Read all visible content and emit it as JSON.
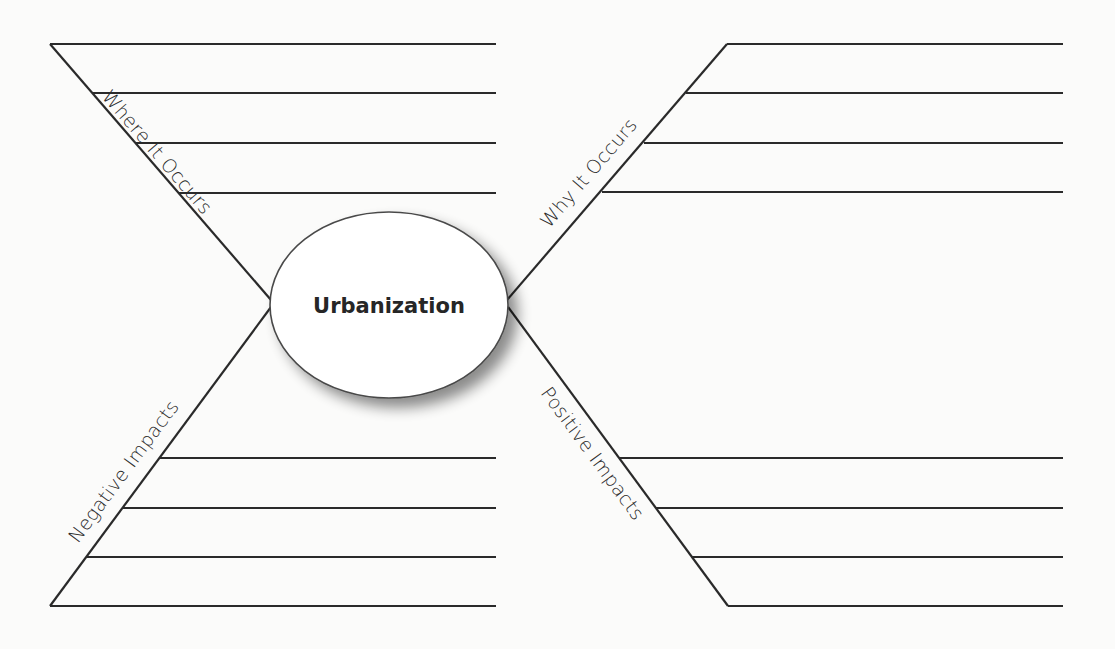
{
  "diagram": {
    "type": "spider-map graphic organizer",
    "center": {
      "label": "Urbanization",
      "cx": 389,
      "cy": 305,
      "rx": 119,
      "ry": 93
    },
    "legs": [
      {
        "id": "top-left",
        "label": "Where It Occurs",
        "diagonal": {
          "x1": 50,
          "y1": 44,
          "x2": 271,
          "y2": 300
        },
        "lines": [
          {
            "x1": 50,
            "y1": 44,
            "x2": 496,
            "y2": 44
          },
          {
            "x1": 93,
            "y1": 93,
            "x2": 496,
            "y2": 93
          },
          {
            "x1": 136,
            "y1": 143,
            "x2": 496,
            "y2": 143
          },
          {
            "x1": 178,
            "y1": 193,
            "x2": 496,
            "y2": 193
          }
        ]
      },
      {
        "id": "top-right",
        "label": "Why It Occurs",
        "diagonal": {
          "x1": 727,
          "y1": 44,
          "x2": 507,
          "y2": 300
        },
        "lines": [
          {
            "x1": 727,
            "y1": 44,
            "x2": 1063,
            "y2": 44
          },
          {
            "x1": 686,
            "y1": 93,
            "x2": 1063,
            "y2": 93
          },
          {
            "x1": 644,
            "y1": 143,
            "x2": 1063,
            "y2": 143
          },
          {
            "x1": 602,
            "y1": 192,
            "x2": 1063,
            "y2": 192
          }
        ]
      },
      {
        "id": "bottom-left",
        "label": "Negative Impacts",
        "diagonal": {
          "x1": 50,
          "y1": 606,
          "x2": 271,
          "y2": 307
        },
        "lines": [
          {
            "x1": 159,
            "y1": 458,
            "x2": 496,
            "y2": 458
          },
          {
            "x1": 122,
            "y1": 508,
            "x2": 496,
            "y2": 508
          },
          {
            "x1": 86,
            "y1": 557,
            "x2": 496,
            "y2": 557
          },
          {
            "x1": 50,
            "y1": 606,
            "x2": 496,
            "y2": 606
          }
        ]
      },
      {
        "id": "bottom-right",
        "label": "Positive Impacts",
        "diagonal": {
          "x1": 508,
          "y1": 307,
          "x2": 728,
          "y2": 606
        },
        "lines": [
          {
            "x1": 619,
            "y1": 458,
            "x2": 1063,
            "y2": 458
          },
          {
            "x1": 656,
            "y1": 508,
            "x2": 1063,
            "y2": 508
          },
          {
            "x1": 692,
            "y1": 557,
            "x2": 1063,
            "y2": 557
          },
          {
            "x1": 728,
            "y1": 606,
            "x2": 1063,
            "y2": 606
          }
        ]
      }
    ],
    "colors": {
      "background": "#fbfbfa",
      "line": "#2a2a2a",
      "ellipse_fill": "#ffffff",
      "ellipse_stroke": "#4a4a4a",
      "shadow": "#9a9a9a"
    }
  }
}
